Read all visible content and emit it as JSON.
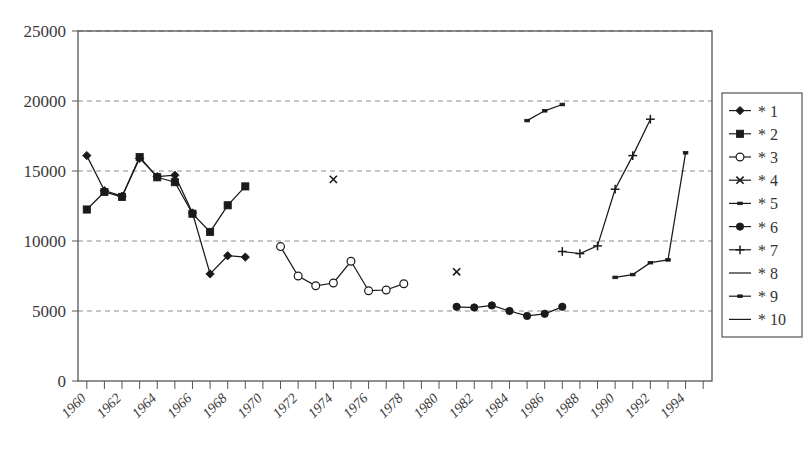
{
  "chart_data": {
    "type": "line",
    "title": "",
    "subtitle": "",
    "xlabel": "",
    "ylabel": "",
    "xlim": [
      1959.5,
      1995.5
    ],
    "ylim": [
      0,
      25000
    ],
    "grid": "horizontal-dashed",
    "legend_position": "right-outside",
    "y_ticks": [
      "0",
      "5000",
      "10000",
      "15000",
      "20000",
      "25000"
    ],
    "y_tick_values": [
      0,
      5000,
      10000,
      15000,
      20000,
      25000
    ],
    "x_ticks": [
      "1960",
      "1962",
      "1964",
      "1966",
      "1968",
      "1970",
      "1972",
      "1974",
      "1976",
      "1978",
      "1980",
      "1982",
      "1984",
      "1986",
      "1988",
      "1990",
      "1992",
      "1994"
    ],
    "x_tick_values": [
      1960,
      1962,
      1964,
      1966,
      1968,
      1970,
      1972,
      1974,
      1976,
      1978,
      1980,
      1982,
      1984,
      1986,
      1988,
      1990,
      1992,
      1994
    ],
    "x_minor_step": 1,
    "series": [
      {
        "name": "* 1",
        "marker": "diamond",
        "color": "#1a1a1a",
        "x": [
          1960,
          1961,
          1962,
          1963,
          1964,
          1965,
          1966,
          1967,
          1968,
          1969,
          1970
        ],
        "values": [
          16100,
          13600,
          13200,
          15900,
          14600,
          14700,
          12000,
          7650,
          8950,
          8850,
          null
        ]
      },
      {
        "name": "* 2",
        "marker": "square",
        "color": "#1a1a1a",
        "x": [
          1960,
          1961,
          1962,
          1963,
          1964,
          1965,
          1966,
          1967,
          1968,
          1969,
          1970
        ],
        "values": [
          12250,
          13500,
          13150,
          16000,
          14550,
          14200,
          11950,
          10650,
          12550,
          13900,
          null
        ]
      },
      {
        "name": "* 3",
        "marker": "circle-open",
        "color": "#1a1a1a",
        "x": [
          1971,
          1972,
          1973,
          1974,
          1975,
          1976,
          1977,
          1978,
          1979
        ],
        "values": [
          9600,
          7500,
          6800,
          7000,
          8550,
          6450,
          6500,
          6950,
          null
        ]
      },
      {
        "name": "* 4",
        "marker": "x",
        "color": "#1a1a1a",
        "x": [
          1974,
          1981
        ],
        "values": [
          14400,
          7800
        ]
      },
      {
        "name": "* 5",
        "marker": "square-small",
        "color": "#1a1a1a",
        "x": [
          1985,
          1986,
          1987
        ],
        "values": [
          18600,
          19300,
          19750
        ]
      },
      {
        "name": "* 6",
        "marker": "circle-filled",
        "color": "#1a1a1a",
        "x": [
          1981,
          1982,
          1983,
          1984,
          1985,
          1986,
          1987
        ],
        "values": [
          5300,
          5250,
          5400,
          5000,
          4650,
          4800,
          5300
        ]
      },
      {
        "name": "* 7",
        "marker": "plus",
        "color": "#1a1a1a",
        "x": [
          1987,
          1988,
          1989,
          1990,
          1991,
          1992
        ],
        "values": [
          9250,
          9100,
          9650,
          13700,
          16100,
          18700
        ]
      },
      {
        "name": "* 8",
        "marker": "line",
        "color": "#1a1a1a",
        "x": [],
        "values": []
      },
      {
        "name": "* 9",
        "marker": "square-small",
        "color": "#1a1a1a",
        "x": [
          1990,
          1991,
          1992,
          1993,
          1994
        ],
        "values": [
          7400,
          7600,
          8450,
          8650,
          16300
        ]
      },
      {
        "name": "* 10",
        "marker": "line",
        "color": "#1a1a1a",
        "x": [],
        "values": []
      }
    ]
  },
  "legend": {
    "items": [
      {
        "label": "* 1",
        "marker": "diamond"
      },
      {
        "label": "* 2",
        "marker": "square"
      },
      {
        "label": "* 3",
        "marker": "circle-open"
      },
      {
        "label": "* 4",
        "marker": "x"
      },
      {
        "label": "* 5",
        "marker": "square-small"
      },
      {
        "label": "* 6",
        "marker": "circle-filled"
      },
      {
        "label": "* 7",
        "marker": "plus"
      },
      {
        "label": "* 8",
        "marker": "line"
      },
      {
        "label": "* 9",
        "marker": "square-small"
      },
      {
        "label": "* 10",
        "marker": "line"
      }
    ]
  },
  "colors": {
    "ink": "#1a1a1a",
    "axis": "#555555",
    "grid": "#8c8c8c",
    "text": "#3a3a3a",
    "background": "#ffffff"
  },
  "caption": {
    "text": ""
  }
}
